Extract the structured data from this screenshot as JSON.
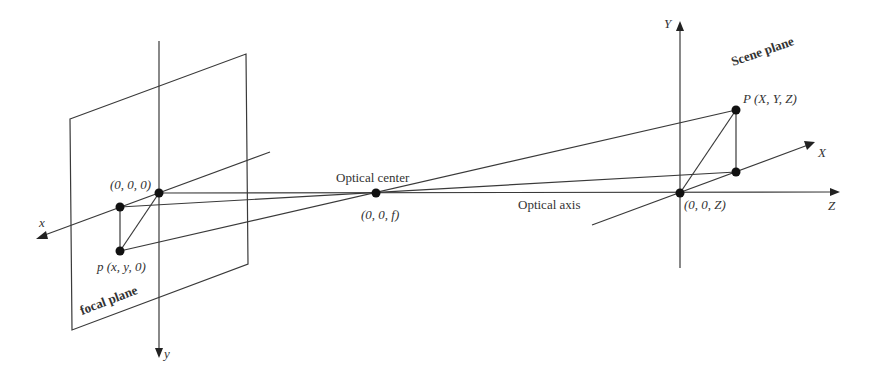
{
  "figure": {
    "type": "pinhole camera projection geometry",
    "background": "#ffffff",
    "line_color": "#3a3a3a",
    "point_color": "#111111"
  },
  "labels": {
    "focal_plane": "focal plane",
    "scene_plane": "Scene plane",
    "optical_center": "Optical center",
    "optical_axis": "Optical axis",
    "origin_point": "(0, 0, 0)",
    "image_point": "p (x, y, 0)",
    "center_point": "(0, 0, f)",
    "scene_origin": "(0, 0, Z)",
    "scene_point": "P (X, Y, Z)"
  },
  "axes": {
    "image_x": "x",
    "image_y": "y",
    "scene_X": "X",
    "scene_Y": "Y",
    "scene_Z": "Z"
  },
  "points": [
    {
      "name": "origin",
      "label": "(0, 0, 0)",
      "px": [
        159,
        193
      ]
    },
    {
      "name": "image-x-projection",
      "px": [
        120,
        207
      ]
    },
    {
      "name": "image-point-p",
      "label": "p (x, y, 0)",
      "px": [
        120,
        251
      ]
    },
    {
      "name": "optical-center",
      "label": "(0, 0, f)",
      "px": [
        376,
        193
      ]
    },
    {
      "name": "scene-origin",
      "label": "(0, 0, Z)",
      "px": [
        680,
        193
      ]
    },
    {
      "name": "scene-X-projection",
      "px": [
        736,
        172
      ]
    },
    {
      "name": "scene-point-P",
      "label": "P (X, Y, Z)",
      "px": [
        736,
        110
      ]
    }
  ]
}
